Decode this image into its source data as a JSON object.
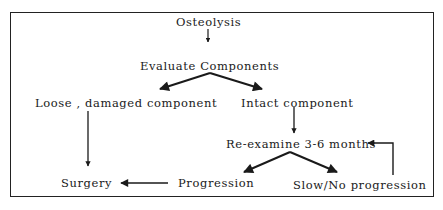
{
  "diagram": {
    "type": "flowchart",
    "nodes": {
      "osteolysis": "Osteolysis",
      "evaluate": "Evaluate Components",
      "loose": "Loose , damaged component",
      "intact": "Intact component",
      "reexamine": "Re-examine 3-6 months",
      "surgery": "Surgery",
      "progression": "Progression",
      "slow": "Slow/No progression"
    },
    "edges": [
      {
        "from": "Osteolysis",
        "to": "Evaluate Components"
      },
      {
        "from": "Evaluate Components",
        "to": "Loose , damaged component"
      },
      {
        "from": "Evaluate Components",
        "to": "Intact component"
      },
      {
        "from": "Loose , damaged component",
        "to": "Surgery"
      },
      {
        "from": "Intact component",
        "to": "Re-examine 3-6 months"
      },
      {
        "from": "Re-examine 3-6 months",
        "to": "Progression"
      },
      {
        "from": "Re-examine 3-6 months",
        "to": "Slow/No progression"
      },
      {
        "from": "Progression",
        "to": "Surgery"
      },
      {
        "from": "Slow/No progression",
        "to": "Re-examine 3-6 months"
      }
    ],
    "colors": {
      "line": "#1a1a1a",
      "background": "#ffffff"
    }
  }
}
